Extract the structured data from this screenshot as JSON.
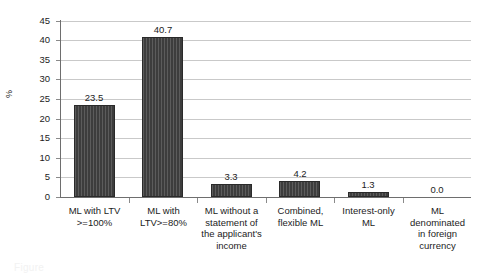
{
  "chart_data": {
    "type": "bar",
    "title": "",
    "xlabel": "",
    "ylabel": "%",
    "ylim": [
      0,
      45
    ],
    "ytick_step": 5,
    "grid": true,
    "legend": "none",
    "bar_color": "#3d3d3d",
    "gridline_color": "#c9c9c9",
    "axis_color": "#6e6e6e",
    "categories": [
      "ML with LTV >=100%",
      "ML with LTV>=80%",
      "ML without a statement of the applicant's income",
      "Combined, flexible ML",
      "Interest-only ML",
      "ML denominated in foreign currency"
    ],
    "category_lines": [
      [
        "ML with LTV",
        ">=100%"
      ],
      [
        "ML with",
        "LTV>=80%"
      ],
      [
        "ML without a",
        "statement of",
        "the applicant's",
        "income"
      ],
      [
        "Combined,",
        "flexible ML"
      ],
      [
        "Interest-only",
        "ML"
      ],
      [
        "ML",
        "denominated",
        "in foreign",
        "currency"
      ]
    ],
    "values": [
      23.5,
      40.7,
      3.3,
      4.2,
      1.3,
      0.0
    ],
    "value_labels": [
      "23.5",
      "40.7",
      "3.3",
      "4.2",
      "1.3",
      "0.0"
    ],
    "ytick_labels": [
      "45",
      "40",
      "35",
      "30",
      "25",
      "20",
      "15",
      "10",
      "5",
      "0"
    ]
  },
  "caption": {
    "text": "Figure"
  }
}
